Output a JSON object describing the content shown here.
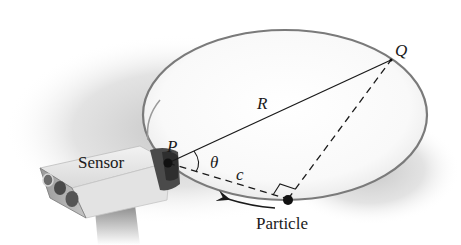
{
  "diagram": {
    "labels": {
      "point_q": "Q",
      "point_p": "P",
      "radius": "R",
      "angle": "θ",
      "chord": "c",
      "sensor": "Sensor",
      "particle": "Particle"
    },
    "elements": {
      "track": "circular-track (ellipse in perspective)",
      "solid_line": "segment P–Q labeled R",
      "dashed_line_1": "segment P–Particle labeled c",
      "dashed_line_2": "segment Particle–Q",
      "right_angle_marker": "at Particle",
      "arrow": "direction of motion along track (counterclockwise toward P)",
      "sensor_device": "box-shaped sensor with three lenses at point P"
    },
    "colors": {
      "track_stroke": "#7a7a7a",
      "line": "#1a1a1a",
      "shadow": "#c8c8c8",
      "sensor_body": "#e6e6e6",
      "sensor_mount": "#5a5a5a"
    }
  }
}
